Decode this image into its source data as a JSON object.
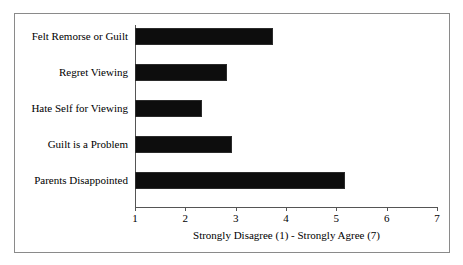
{
  "chart_data": {
    "type": "bar",
    "orientation": "horizontal",
    "title": "",
    "subtitle": "",
    "xlabel": "Strongly Disagree (1) - Strongly Agree (7)",
    "ylabel": "",
    "categories": [
      "Felt Remorse or Guilt",
      "Regret Viewing",
      "Hate Self for Viewing",
      "Guilt is a Problem",
      "Parents Disappointed"
    ],
    "values": [
      3.74,
      2.83,
      2.33,
      2.93,
      5.17
    ],
    "xlim": [
      1,
      7
    ],
    "xticks": [
      1,
      2,
      3,
      4,
      5,
      6,
      7
    ],
    "xtick_labels": [
      "1",
      "2",
      "3",
      "4",
      "5",
      "6",
      "7"
    ],
    "grid": false,
    "legend": false,
    "bar_color": "#0d0d0d",
    "axis_color": "#555555",
    "frame_color": "#8a8a8a",
    "background": "#ffffff"
  }
}
